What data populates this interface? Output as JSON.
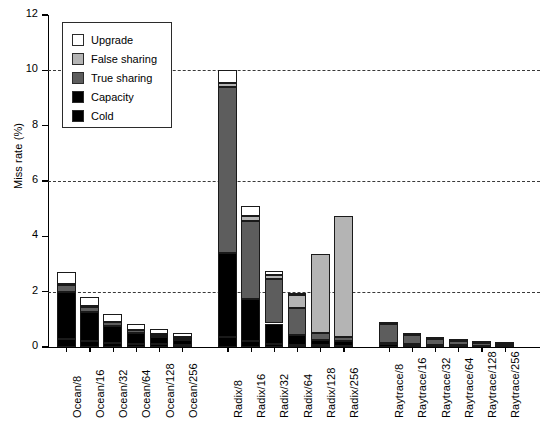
{
  "chart_data": {
    "type": "bar",
    "title": "",
    "xlabel": "",
    "ylabel": "Miss rate (%)",
    "ylim": [
      0,
      12
    ],
    "yticks": [
      0,
      2,
      4,
      6,
      8,
      10,
      12
    ],
    "ytick_labels": [
      "0",
      "2",
      "4",
      "6",
      "8",
      "10",
      "12"
    ],
    "gridlines": [
      2,
      6,
      10
    ],
    "grid": "horizontal-dashed",
    "stacked": true,
    "legend_position": "upper-left-inside",
    "legend_entries": [
      "Upgrade",
      "False sharing",
      "True sharing",
      "Capacity",
      "Cold"
    ],
    "colors": {
      "Upgrade": "#ffffff",
      "False sharing": "#b4b4b4",
      "True sharing": "#5d5d5d",
      "Capacity": "#000000",
      "Cold": "#000000",
      "edge": "#1a1a1a",
      "grid": "#3a3a3a",
      "axis": "#000000"
    },
    "groups": [
      "Ocean",
      "Radix",
      "Raytrace"
    ],
    "categories": [
      "Ocean/8",
      "Ocean/16",
      "Ocean/32",
      "Ocean/64",
      "Ocean/128",
      "Ocean/256",
      "Radix/8",
      "Radix/16",
      "Radix/32",
      "Radix/64",
      "Radix/128",
      "Radix/256",
      "Raytrace/8",
      "Raytrace/16",
      "Raytrace/32",
      "Raytrace/64",
      "Raytrace/128",
      "Raytrace/256"
    ],
    "series": [
      {
        "name": "Cold",
        "values": [
          0.3,
          0.2,
          0.16,
          0.12,
          0.1,
          0.08,
          0.35,
          0.2,
          0.12,
          0.08,
          0.06,
          0.05,
          0.1,
          0.06,
          0.05,
          0.04,
          0.03,
          0.02
        ]
      },
      {
        "name": "Capacity",
        "values": [
          1.7,
          1.05,
          0.59,
          0.38,
          0.25,
          0.17,
          3.05,
          1.55,
          0.73,
          0.37,
          0.19,
          0.15,
          0.05,
          0.04,
          0.03,
          0.02,
          0.02,
          0.01
        ]
      },
      {
        "name": "True sharing",
        "values": [
          0.25,
          0.2,
          0.14,
          0.1,
          0.09,
          0.08,
          6.0,
          2.8,
          1.6,
          0.95,
          0.25,
          0.17,
          0.68,
          0.34,
          0.2,
          0.17,
          0.1,
          0.07
        ]
      },
      {
        "name": "False sharing",
        "values": [
          0.03,
          0.03,
          0.03,
          0.03,
          0.03,
          0.03,
          0.16,
          0.2,
          0.15,
          0.48,
          2.85,
          4.35,
          0.02,
          0.01,
          0.01,
          0.01,
          0.01,
          0.01
        ]
      },
      {
        "name": "Upgrade",
        "values": [
          0.42,
          0.32,
          0.28,
          0.22,
          0.18,
          0.14,
          0.44,
          0.35,
          0.15,
          0.09,
          0.0,
          0.0,
          0.0,
          0.0,
          0.0,
          0.0,
          0.0,
          0.0
        ]
      }
    ],
    "totals": [
      2.7,
      1.8,
      1.2,
      0.85,
      0.65,
      0.5,
      10.0,
      5.1,
      2.75,
      1.97,
      3.35,
      4.72,
      0.85,
      0.45,
      0.29,
      0.24,
      0.16,
      0.11
    ]
  }
}
